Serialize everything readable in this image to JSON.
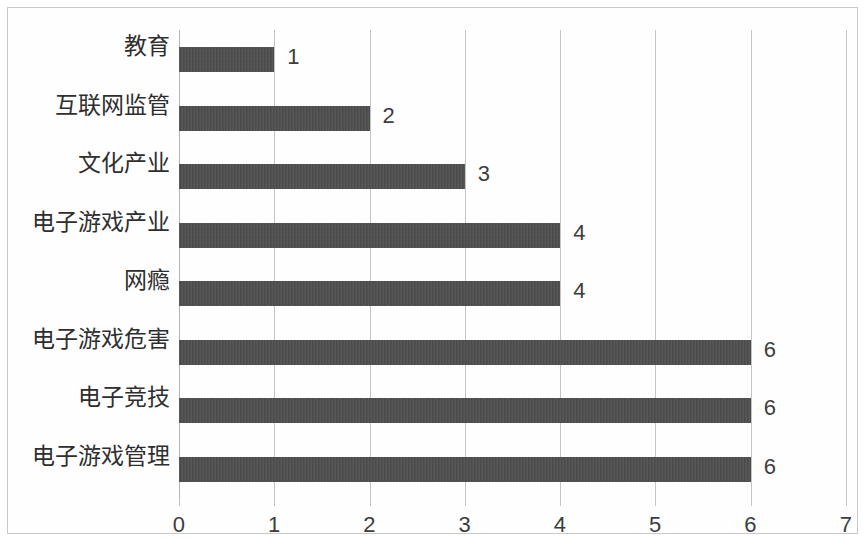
{
  "chart_data": {
    "type": "bar",
    "orientation": "horizontal",
    "title": "",
    "subtitle": "",
    "xlabel": "",
    "ylabel": "",
    "categories": [
      "教育",
      "互联网监管",
      "文化产业",
      "电子游戏产业",
      "网瘾",
      "电子游戏危害",
      "电子竞技",
      "电子游戏管理"
    ],
    "values": [
      1,
      2,
      3,
      4,
      4,
      6,
      6,
      6
    ],
    "data_labels": [
      "1",
      "2",
      "3",
      "4",
      "4",
      "6",
      "6",
      "6"
    ],
    "xlim": [
      0,
      7
    ],
    "x_ticks": [
      0,
      1,
      2,
      3,
      4,
      5,
      6,
      7
    ],
    "x_tick_labels": [
      "0",
      "1",
      "2",
      "3",
      "4",
      "5",
      "6",
      "7"
    ],
    "grid": true,
    "grid_axis": "x",
    "legend": false,
    "legend_position": "none",
    "bar_color": "#4b4b4b",
    "gridline_color": "#c4c4c4",
    "border_color": "#c9c9c9",
    "background_color": "#ffffff",
    "text_color": "#2e2e2e"
  }
}
